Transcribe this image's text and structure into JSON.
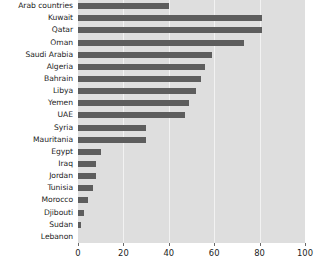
{
  "chart_data": {
    "type": "bar",
    "orientation": "horizontal",
    "title": "",
    "subtitle": "",
    "xlabel": "",
    "ylabel": "",
    "xlim": [
      0,
      100
    ],
    "ylim": null,
    "grid": true,
    "legend": false,
    "legend_position": "none",
    "xticks": [
      "0",
      "20",
      "40",
      "60",
      "80",
      "100"
    ],
    "xtick_values": [
      0,
      20,
      40,
      60,
      80,
      100
    ],
    "categories": [
      "Arab countries",
      "Kuwait",
      "Qatar",
      "Oman",
      "Saudi Arabia",
      "Algeria",
      "Bahrain",
      "Libya",
      "Yemen",
      "UAE",
      "Syria",
      "Mauritania",
      "Egypt",
      "Iraq",
      "Jordan",
      "Tunisia",
      "Morocco",
      "Djibouti",
      "Sudan",
      "Lebanon"
    ],
    "values": [
      40,
      81,
      81,
      73,
      59,
      56,
      54,
      52,
      49,
      47,
      30,
      30,
      10,
      8,
      8,
      6.5,
      4.5,
      2.5,
      1.5,
      0
    ],
    "series": [
      {
        "name": "value",
        "values": [
          40,
          81,
          81,
          73,
          59,
          56,
          54,
          52,
          49,
          47,
          30,
          30,
          10,
          8,
          8,
          6.5,
          4.5,
          2.5,
          1.5,
          0
        ]
      }
    ]
  },
  "style": {
    "bar_color": "#5d5d5d",
    "plot_background": "#dedede",
    "page_background": "#ffffff",
    "gridline_color": "#f2f2f2",
    "text_color": "#1c1c1c"
  }
}
